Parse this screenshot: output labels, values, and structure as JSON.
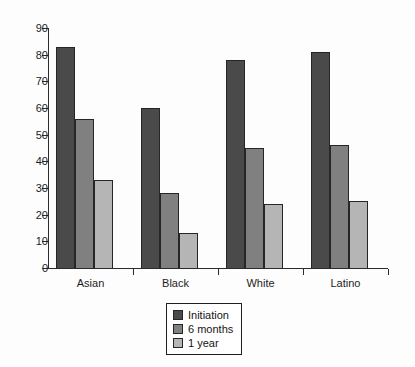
{
  "chart_data": {
    "type": "bar",
    "title": "",
    "subtitle": "",
    "xlabel": "",
    "ylabel": "",
    "ylim": [
      0,
      90
    ],
    "ytick_step": 10,
    "yticks": [
      0,
      10,
      20,
      30,
      40,
      50,
      60,
      70,
      80,
      90
    ],
    "grid": false,
    "legend_position": "bottom-center",
    "categories": [
      "Asian",
      "Black",
      "White",
      "Latino"
    ],
    "series": [
      {
        "name": "Initiation",
        "color": "#4a4a4a",
        "values": [
          83,
          60,
          78,
          81
        ]
      },
      {
        "name": "6 months",
        "color": "#808080",
        "values": [
          56,
          28,
          45,
          46
        ]
      },
      {
        "name": "1 year",
        "color": "#b5b5b5",
        "values": [
          33,
          13,
          24,
          25
        ]
      }
    ]
  },
  "legend": {
    "items": [
      {
        "label": "Initiation",
        "color": "#4a4a4a"
      },
      {
        "label": "6 months",
        "color": "#808080"
      },
      {
        "label": "1 year",
        "color": "#b5b5b5"
      }
    ]
  },
  "axis": {
    "y_tick_labels": [
      "0",
      "10",
      "20",
      "30",
      "40",
      "50",
      "60",
      "70",
      "80",
      "90"
    ],
    "x_tick_labels": [
      "Asian",
      "Black",
      "White",
      "Latino"
    ]
  }
}
